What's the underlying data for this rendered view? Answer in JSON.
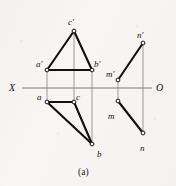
{
  "figure": {
    "caption": "(a)",
    "axis": {
      "left_label": "X",
      "right_label": "O",
      "y": 88,
      "x_start": 22,
      "x_end": 152,
      "color": "#6e6e6e"
    },
    "colors": {
      "heavy_line": "#111111",
      "thin_line": "#8a8a8a",
      "vertex_fill": "#ffffff",
      "vertex_stroke": "#111111",
      "text": "#121212",
      "paper": "#f7f6f4"
    },
    "vertices": [
      {
        "id": "c-prime",
        "label": "c'",
        "x": 74,
        "y": 31,
        "label_x": 68,
        "label_y": 18
      },
      {
        "id": "a-prime",
        "label": "a'",
        "x": 47,
        "y": 70,
        "label_x": 36,
        "label_y": 60
      },
      {
        "id": "b-prime",
        "label": "b'",
        "x": 92,
        "y": 70,
        "label_x": 94,
        "label_y": 60
      },
      {
        "id": "a",
        "label": "a",
        "x": 47,
        "y": 102,
        "label_x": 37,
        "label_y": 93
      },
      {
        "id": "c",
        "label": "c",
        "x": 74,
        "y": 102,
        "label_x": 76,
        "label_y": 93
      },
      {
        "id": "b",
        "label": "b",
        "x": 92,
        "y": 144,
        "label_x": 97,
        "label_y": 150
      },
      {
        "id": "m-prime",
        "label": "m'",
        "x": 118,
        "y": 80,
        "label_x": 106,
        "label_y": 70
      },
      {
        "id": "n-prime",
        "label": "n'",
        "x": 143,
        "y": 43,
        "label_x": 137,
        "label_y": 31
      },
      {
        "id": "m",
        "label": "m",
        "x": 118,
        "y": 101,
        "label_x": 108,
        "label_y": 112
      },
      {
        "id": "n",
        "label": "n",
        "x": 143,
        "y": 133,
        "label_x": 140,
        "label_y": 144
      }
    ],
    "heavy_edges": [
      {
        "id": "edge-ap-cp",
        "from": "a-prime",
        "to": "c-prime"
      },
      {
        "id": "edge-cp-bp",
        "from": "c-prime",
        "to": "b-prime"
      },
      {
        "id": "edge-ap-bp",
        "from": "a-prime",
        "to": "b-prime"
      },
      {
        "id": "edge-a-c",
        "from": "a",
        "to": "c"
      },
      {
        "id": "edge-a-b",
        "from": "a",
        "to": "b"
      },
      {
        "id": "edge-c-b",
        "from": "c",
        "to": "b"
      },
      {
        "id": "edge-mp-np",
        "from": "m-prime",
        "to": "n-prime"
      },
      {
        "id": "edge-m-n",
        "from": "m",
        "to": "n"
      }
    ],
    "projection_lines": [
      {
        "id": "proj-a",
        "x1": 47,
        "y1": 70,
        "x2": 47,
        "y2": 102
      },
      {
        "id": "proj-c",
        "x1": 74,
        "y1": 31,
        "x2": 74,
        "y2": 102
      },
      {
        "id": "proj-b",
        "x1": 92,
        "y1": 70,
        "x2": 92,
        "y2": 144
      },
      {
        "id": "proj-m",
        "x1": 118,
        "y1": 80,
        "x2": 118,
        "y2": 101
      },
      {
        "id": "proj-n",
        "x1": 143,
        "y1": 43,
        "x2": 143,
        "y2": 133
      }
    ]
  }
}
